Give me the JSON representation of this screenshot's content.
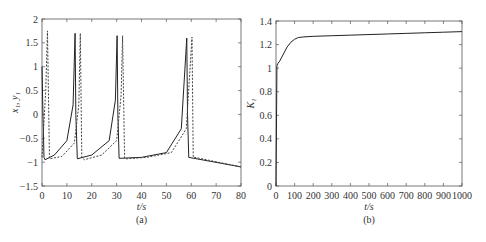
{
  "chart_data": [
    {
      "type": "line",
      "panel": "(a)",
      "xlabel": "t/s",
      "ylabel": "x1, y1",
      "xlim": [
        0,
        80
      ],
      "ylim": [
        -1.5,
        2
      ],
      "xticks": [
        "0",
        "10",
        "20",
        "30",
        "40",
        "50",
        "60",
        "70",
        "80"
      ],
      "yticks": [
        "2",
        "1.5",
        "1",
        "0.5",
        "0",
        "-0.5",
        "-1",
        "-1.5"
      ],
      "grid": false,
      "series": [
        {
          "name": "x1",
          "style": "solid",
          "x": [
            0,
            0.3,
            0.8,
            1.2,
            5,
            10,
            12.5,
            13.3,
            13.6,
            14.2,
            20,
            27,
            29.5,
            30.2,
            30.5,
            31,
            40,
            50,
            56,
            58.2,
            58.5,
            59,
            80
          ],
          "y": [
            1.0,
            0.2,
            -0.9,
            -0.95,
            -0.85,
            -0.55,
            0.2,
            1.7,
            0.0,
            -0.93,
            -0.85,
            -0.55,
            0.3,
            1.65,
            0.0,
            -0.92,
            -0.9,
            -0.8,
            -0.3,
            1.6,
            0.0,
            -0.9,
            -1.1
          ]
        },
        {
          "name": "y1",
          "style": "dashed",
          "x": [
            0,
            1.5,
            2.2,
            3,
            8,
            13,
            14.8,
            15.4,
            16,
            17,
            24,
            30,
            31.8,
            32.4,
            33.2,
            34,
            42,
            52,
            58,
            60.3,
            60.8,
            61.5,
            80
          ],
          "y": [
            -0.9,
            0.5,
            1.75,
            -0.93,
            -0.88,
            -0.6,
            0.2,
            1.7,
            -0.9,
            -0.95,
            -0.85,
            -0.55,
            0.4,
            1.65,
            -0.92,
            -0.93,
            -0.9,
            -0.8,
            -0.3,
            1.62,
            -0.9,
            -0.9,
            -1.1
          ]
        }
      ],
      "caption": "(a)"
    },
    {
      "type": "line",
      "panel": "(b)",
      "xlabel": "t/s",
      "ylabel": "K1",
      "xlim": [
        0,
        1000
      ],
      "ylim": [
        0,
        1.4
      ],
      "xticks": [
        "0",
        "100",
        "200",
        "300",
        "400",
        "500",
        "600",
        "700",
        "800",
        "900",
        "1000"
      ],
      "yticks": [
        "1.4",
        "1.2",
        "1",
        "0.8",
        "0.6",
        "0.4",
        "0.2",
        "0"
      ],
      "grid": false,
      "series": [
        {
          "name": "K1",
          "style": "solid",
          "x": [
            0,
            5,
            10,
            20,
            40,
            60,
            80,
            100,
            120,
            150,
            200,
            300,
            400,
            500,
            600,
            700,
            800,
            900,
            1000
          ],
          "y": [
            0,
            1.02,
            1.04,
            1.06,
            1.12,
            1.18,
            1.22,
            1.245,
            1.26,
            1.265,
            1.27,
            1.275,
            1.28,
            1.285,
            1.29,
            1.295,
            1.3,
            1.305,
            1.31
          ]
        }
      ],
      "caption": "(b)"
    }
  ],
  "labels": {
    "a": {
      "xlabel": "t/s",
      "ylabel": "x₁, y₁",
      "caption": "(a)"
    },
    "b": {
      "xlabel": "t/s",
      "ylabel": "K₁",
      "caption": "(b)"
    }
  }
}
